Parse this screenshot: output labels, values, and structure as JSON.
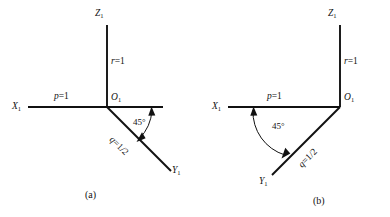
{
  "figure": {
    "background_color": "#ffffff",
    "line_color": "#111111",
    "panels": [
      {
        "id": "a",
        "caption": "(a)",
        "axes": [
          {
            "name": "x-axis",
            "label": "X",
            "subscript": "1"
          },
          {
            "name": "y-axis",
            "label": "Y",
            "subscript": "1"
          },
          {
            "name": "z-axis",
            "label": "Z",
            "subscript": "1"
          }
        ],
        "origin_label": "O",
        "origin_subscript": "1",
        "annotations": [
          {
            "name": "x-scale",
            "var": "p",
            "eq": "=1",
            "text": "p=1"
          },
          {
            "name": "z-scale",
            "var": "r",
            "eq": "=1",
            "text": "r=1"
          },
          {
            "name": "y-scale",
            "var": "q",
            "eq": "=1/2",
            "text": "q=1/2"
          },
          {
            "name": "angle",
            "text": "45°"
          }
        ]
      },
      {
        "id": "b",
        "caption": "(b)",
        "axes": [
          {
            "name": "x-axis",
            "label": "X",
            "subscript": "1"
          },
          {
            "name": "y-axis",
            "label": "Y",
            "subscript": "1"
          },
          {
            "name": "z-axis",
            "label": "Z",
            "subscript": "1"
          }
        ],
        "origin_label": "O",
        "origin_subscript": "1",
        "annotations": [
          {
            "name": "x-scale",
            "var": "p",
            "eq": "=1",
            "text": "p=1"
          },
          {
            "name": "z-scale",
            "var": "r",
            "eq": "=1",
            "text": "r=1"
          },
          {
            "name": "y-scale",
            "var": "q",
            "eq": "=1/2",
            "text": "q=1/2"
          },
          {
            "name": "angle",
            "text": "45°"
          }
        ]
      }
    ]
  },
  "panel_a": {
    "z_label": "Z",
    "z_sub": "1",
    "x_label": "X",
    "x_sub": "1",
    "y_label": "Y",
    "y_sub": "1",
    "origin": "O",
    "origin_sub": "1",
    "p_var": "p",
    "p_eq": "=1",
    "r_var": "r",
    "r_eq": "=1",
    "q_var": "q",
    "q_eq": "=1/2",
    "angle": "45°",
    "caption": "(a)"
  },
  "panel_b": {
    "z_label": "Z",
    "z_sub": "1",
    "x_label": "X",
    "x_sub": "1",
    "y_label": "Y",
    "y_sub": "1",
    "origin": "O",
    "origin_sub": "1",
    "p_var": "p",
    "p_eq": "=1",
    "r_var": "r",
    "r_eq": "=1",
    "q_var": "q",
    "q_eq": "=1/2",
    "angle": "45°",
    "caption": "(b)"
  }
}
